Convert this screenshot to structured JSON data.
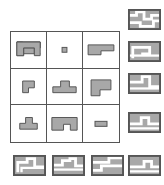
{
  "puzzle": {
    "title": "visual-analogy-matrix",
    "type": "3x3-matrix-with-answer-options",
    "colors": {
      "shape_fill": "#a8a8a8",
      "shape_stroke": "#555555",
      "cell_background": "#ffffff",
      "grid_line": "#555555",
      "page_background": "#ffffff"
    },
    "matrix": {
      "rows": 3,
      "columns": 3,
      "cells": [
        {
          "id": "cell-r1c1",
          "row": 1,
          "col": 1,
          "shape_name": "arch-inverted-u",
          "label": "inverted U arch"
        },
        {
          "id": "cell-r1c2",
          "row": 1,
          "col": 2,
          "shape_name": "small-square",
          "label": "tiny square"
        },
        {
          "id": "cell-r1c3",
          "row": 1,
          "col": 3,
          "shape_name": "step-bar-right",
          "label": "horizontal bar with step"
        },
        {
          "id": "cell-r2c1",
          "row": 2,
          "col": 1,
          "shape_name": "small-gamma",
          "label": "small P shape"
        },
        {
          "id": "cell-r2c2",
          "row": 2,
          "col": 2,
          "shape_name": "tee",
          "label": "T shape"
        },
        {
          "id": "cell-r2c3",
          "row": 2,
          "col": 3,
          "shape_name": "large-gamma",
          "label": "large P shape"
        },
        {
          "id": "cell-r3c1",
          "row": 3,
          "col": 1,
          "shape_name": "small-tee",
          "label": "small T shape"
        },
        {
          "id": "cell-r3c2",
          "row": 3,
          "col": 2,
          "shape_name": "notched-rectangle",
          "label": "rectangle with bottom notch"
        },
        {
          "id": "cell-r3c3",
          "row": 3,
          "col": 3,
          "shape_name": "small-rectangle",
          "label": "small horizontal rectangle"
        }
      ]
    },
    "options": {
      "count": 8,
      "right_column": [
        {
          "id": "option-1",
          "index": 1,
          "shape_name": "maze-step-pattern-a"
        },
        {
          "id": "option-2",
          "index": 2,
          "shape_name": "maze-spiral-pattern-b"
        },
        {
          "id": "option-3",
          "index": 3,
          "shape_name": "maze-step-pattern-c"
        },
        {
          "id": "option-4",
          "index": 4,
          "shape_name": "maze-step-pattern-d"
        }
      ],
      "bottom_row": [
        {
          "id": "option-5",
          "index": 5,
          "shape_name": "maze-step-pattern-e"
        },
        {
          "id": "option-6",
          "index": 6,
          "shape_name": "maze-step-pattern-f"
        },
        {
          "id": "option-7",
          "index": 7,
          "shape_name": "maze-step-pattern-g"
        },
        {
          "id": "option-8",
          "index": 8,
          "shape_name": "maze-step-pattern-h"
        }
      ]
    }
  }
}
